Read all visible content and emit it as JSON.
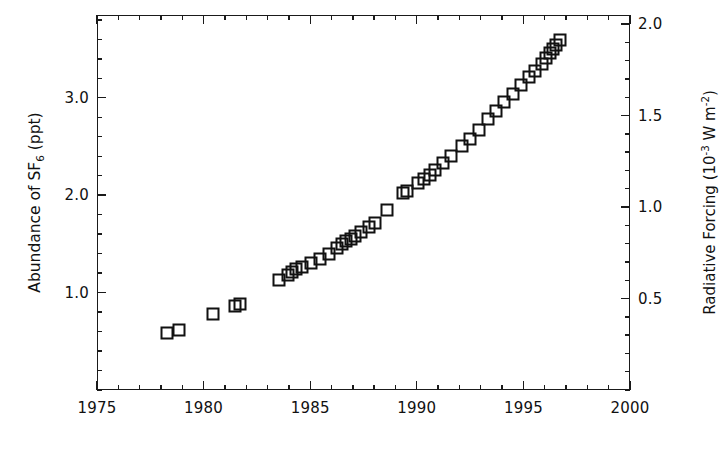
{
  "chart_data": {
    "type": "scatter",
    "title": "",
    "xlabel": "",
    "ylabel": "Abundance of SF6 (ppt)",
    "ylabel_parts": {
      "pre": "Abundance of SF",
      "sub": "6",
      "post": " (ppt)"
    },
    "y2label": "Radiative Forcing (10-3 W m-2)",
    "y2label_parts": {
      "pre": "Radiative Forcing (10",
      "sup1": "-3",
      "mid": " W m",
      "sup2": "-2",
      "post": ")"
    },
    "xlim": [
      1975,
      2000
    ],
    "ylim": [
      0.0,
      3.85
    ],
    "y2lim": [
      0.0,
      2.05
    ],
    "grid": false,
    "legend": null,
    "marker": "open-square",
    "marker_color": "#111111",
    "xticks": [
      1975,
      1980,
      1985,
      1990,
      1995,
      2000
    ],
    "xticklabels": [
      "1975",
      "1980",
      "1985",
      "1990",
      "1995",
      "2000"
    ],
    "x_minor_step": 1,
    "yticks": [
      1.0,
      2.0,
      3.0
    ],
    "yticklabels": [
      "1.0",
      "2.0",
      "3.0"
    ],
    "y_minor_step": 0.2,
    "y2ticks": [
      0.5,
      1.0,
      1.5,
      2.0
    ],
    "y2ticklabels": [
      "0.5",
      "1.0",
      "1.5",
      "2.0"
    ],
    "y2_minor_step": 0.1,
    "series": [
      {
        "name": "SF6 abundance",
        "points": [
          [
            1978.3,
            0.59
          ],
          [
            1978.85,
            0.62
          ],
          [
            1980.45,
            0.78
          ],
          [
            1981.45,
            0.86
          ],
          [
            1981.7,
            0.88
          ],
          [
            1983.55,
            1.13
          ],
          [
            1983.95,
            1.18
          ],
          [
            1984.15,
            1.21
          ],
          [
            1984.35,
            1.24
          ],
          [
            1984.6,
            1.26
          ],
          [
            1985.05,
            1.3
          ],
          [
            1985.45,
            1.35
          ],
          [
            1985.9,
            1.4
          ],
          [
            1986.25,
            1.46
          ],
          [
            1986.5,
            1.5
          ],
          [
            1986.7,
            1.53
          ],
          [
            1986.9,
            1.55
          ],
          [
            1987.1,
            1.58
          ],
          [
            1987.4,
            1.62
          ],
          [
            1987.75,
            1.67
          ],
          [
            1988.05,
            1.71
          ],
          [
            1988.6,
            1.85
          ],
          [
            1989.35,
            2.02
          ],
          [
            1989.55,
            2.04
          ],
          [
            1990.05,
            2.13
          ],
          [
            1990.35,
            2.17
          ],
          [
            1990.6,
            2.21
          ],
          [
            1990.85,
            2.26
          ],
          [
            1991.25,
            2.33
          ],
          [
            1991.6,
            2.4
          ],
          [
            1992.1,
            2.5
          ],
          [
            1992.5,
            2.58
          ],
          [
            1992.9,
            2.67
          ],
          [
            1993.35,
            2.78
          ],
          [
            1993.7,
            2.86
          ],
          [
            1994.1,
            2.96
          ],
          [
            1994.5,
            3.04
          ],
          [
            1994.9,
            3.13
          ],
          [
            1995.25,
            3.21
          ],
          [
            1995.55,
            3.28
          ],
          [
            1995.85,
            3.35
          ],
          [
            1996.05,
            3.41
          ],
          [
            1996.25,
            3.46
          ],
          [
            1996.4,
            3.5
          ],
          [
            1996.55,
            3.54
          ],
          [
            1996.7,
            3.59
          ]
        ]
      }
    ]
  },
  "axes": {
    "x_tick_labels": [
      "1975",
      "1980",
      "1985",
      "1990",
      "1995",
      "2000"
    ],
    "y_tick_labels": [
      "1.0",
      "2.0",
      "3.0"
    ],
    "y2_tick_labels": [
      "0.5",
      "1.0",
      "1.5",
      "2.0"
    ]
  }
}
